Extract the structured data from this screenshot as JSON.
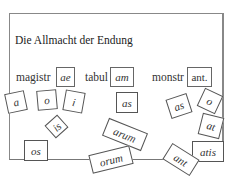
{
  "title": "Die Allmacht der Endung",
  "stems": [
    {
      "stem": "magistr",
      "ending": "ae"
    },
    {
      "stem": "tabul",
      "ending": "am"
    },
    {
      "stem": "monstr",
      "ending": "ant."
    }
  ],
  "tiles": [
    "a",
    "o",
    "i",
    "is",
    "os",
    "as",
    "arum",
    "orum",
    "as",
    "o",
    "at",
    "atis",
    "ant"
  ],
  "colors": {
    "border": "#666666",
    "text": "#333333",
    "background": "#ffffff"
  }
}
